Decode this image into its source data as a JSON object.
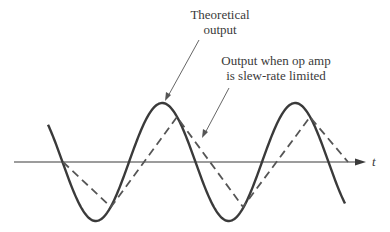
{
  "figure": {
    "labels": {
      "theoretical_line1": "Theoretical",
      "theoretical_line2": "output",
      "slew_line1": "Output when op amp",
      "slew_line2": "is slew-rate limited",
      "time_axis": "t"
    },
    "colors": {
      "ink": "#3a3a3a",
      "background": "#ffffff"
    },
    "curves": [
      {
        "name": "theoretical-output",
        "style": "solid",
        "shape": "sine"
      },
      {
        "name": "slew-rate-limited-output",
        "style": "dashed",
        "shape": "triangle"
      }
    ]
  }
}
